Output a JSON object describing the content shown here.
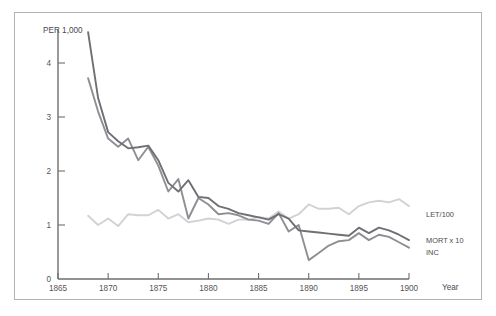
{
  "chart_data": {
    "type": "line",
    "title": "",
    "subtitle": "",
    "xlabel": "Year",
    "ylabel": "PER 1,000",
    "xlim": [
      1865,
      1900
    ],
    "ylim": [
      0,
      4.6
    ],
    "grid": false,
    "legend_position": "right-inline",
    "xticks": [
      "1865",
      "1870",
      "1875",
      "1880",
      "1885",
      "1890",
      "1895",
      "1900"
    ],
    "xtick_values": [
      1865,
      1870,
      1875,
      1880,
      1885,
      1890,
      1895,
      1900
    ],
    "yticks": [
      "0",
      "1",
      "2",
      "3",
      "4"
    ],
    "ytick_values": [
      0,
      1,
      2,
      3,
      4
    ],
    "series": [
      {
        "name": "MORT x 10",
        "color": "#6f6f74",
        "width": 1.9,
        "x": [
          1868,
          1869,
          1870,
          1871,
          1872,
          1873,
          1874,
          1875,
          1876,
          1877,
          1878,
          1879,
          1880,
          1881,
          1882,
          1883,
          1884,
          1885,
          1886,
          1887,
          1888,
          1889,
          1890,
          1891,
          1892,
          1893,
          1894,
          1895,
          1896,
          1897,
          1898,
          1899,
          1900
        ],
        "values": [
          4.57,
          3.35,
          2.72,
          2.55,
          2.42,
          2.44,
          2.47,
          2.2,
          1.78,
          1.62,
          1.83,
          1.52,
          1.5,
          1.35,
          1.3,
          1.22,
          1.18,
          1.14,
          1.1,
          1.2,
          1.12,
          0.9,
          0.88,
          0.86,
          0.84,
          0.82,
          0.8,
          0.95,
          0.85,
          0.95,
          0.9,
          0.82,
          0.72
        ]
      },
      {
        "name": "INC",
        "color": "#8e8e94",
        "width": 1.9,
        "x": [
          1868,
          1869,
          1870,
          1871,
          1872,
          1873,
          1874,
          1875,
          1876,
          1877,
          1878,
          1879,
          1880,
          1881,
          1882,
          1883,
          1884,
          1885,
          1886,
          1887,
          1888,
          1889,
          1890,
          1891,
          1892,
          1893,
          1894,
          1895,
          1896,
          1897,
          1898,
          1899,
          1900
        ],
        "values": [
          3.72,
          3.1,
          2.6,
          2.45,
          2.6,
          2.2,
          2.45,
          2.1,
          1.62,
          1.85,
          1.12,
          1.5,
          1.38,
          1.2,
          1.22,
          1.18,
          1.1,
          1.08,
          1.02,
          1.22,
          0.88,
          1.0,
          0.35,
          0.48,
          0.62,
          0.7,
          0.72,
          0.85,
          0.72,
          0.82,
          0.78,
          0.68,
          0.58
        ]
      },
      {
        "name": "LET/100",
        "color": "#d2d2d4",
        "width": 1.9,
        "x": [
          1868,
          1869,
          1870,
          1871,
          1872,
          1873,
          1874,
          1875,
          1876,
          1877,
          1878,
          1879,
          1880,
          1881,
          1882,
          1883,
          1884,
          1885,
          1886,
          1887,
          1888,
          1889,
          1890,
          1891,
          1892,
          1893,
          1894,
          1895,
          1896,
          1897,
          1898,
          1899,
          1900
        ],
        "values": [
          1.17,
          1.0,
          1.12,
          0.98,
          1.2,
          1.18,
          1.18,
          1.28,
          1.12,
          1.2,
          1.05,
          1.08,
          1.12,
          1.1,
          1.02,
          1.1,
          1.1,
          1.15,
          1.12,
          1.25,
          1.12,
          1.2,
          1.38,
          1.3,
          1.3,
          1.32,
          1.2,
          1.35,
          1.42,
          1.45,
          1.42,
          1.48,
          1.35
        ]
      }
    ],
    "annotations": [
      {
        "text": "LET/100",
        "series": "LET/100",
        "x": 1901.4,
        "y": 1.2
      },
      {
        "text": "MORT x 10",
        "series": "MORT x 10",
        "x": 1901.4,
        "y": 0.72
      },
      {
        "text": "INC",
        "series": "INC",
        "x": 1901.4,
        "y": 0.5
      }
    ]
  },
  "frame": {
    "border_color": "#b3b3b3",
    "background": "#ffffff"
  }
}
